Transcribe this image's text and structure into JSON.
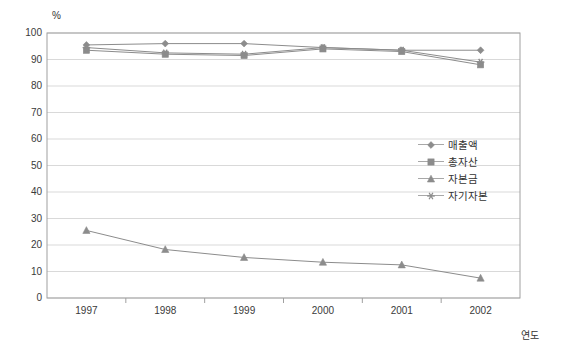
{
  "chart_data": {
    "type": "line",
    "title": "",
    "xlabel": "연도",
    "ylabel": "%",
    "categories": [
      "1997",
      "1998",
      "1999",
      "2000",
      "2001",
      "2002"
    ],
    "ylim": [
      0,
      100
    ],
    "ytick_step": 10,
    "yticks": [
      "100",
      "90",
      "80",
      "70",
      "60",
      "50",
      "40",
      "30",
      "20",
      "10",
      "0"
    ],
    "grid": true,
    "legend_position": "center-right",
    "series": [
      {
        "name": "매출액",
        "marker": "diamond",
        "color": "#8c8c8c",
        "values": [
          95.5,
          96.0,
          96.0,
          94.5,
          93.5,
          93.5
        ]
      },
      {
        "name": "총자산",
        "marker": "square",
        "color": "#8c8c8c",
        "values": [
          93.5,
          92.0,
          91.5,
          94.0,
          93.0,
          88.0
        ]
      },
      {
        "name": "자본금",
        "marker": "triangle",
        "color": "#8c8c8c",
        "values": [
          25.5,
          18.3,
          15.3,
          13.5,
          12.5,
          7.5
        ]
      },
      {
        "name": "자기자본",
        "marker": "star",
        "color": "#8c8c8c",
        "values": [
          94.5,
          92.5,
          92.0,
          94.5,
          93.5,
          89.0
        ]
      }
    ]
  },
  "axes": {
    "unit_label": "%",
    "x_title": "연도"
  },
  "colors": {
    "line": "#8c8c8c",
    "grid": "#d9d9d9",
    "frame": "#a0a0a0",
    "text": "#3a3a3a"
  }
}
